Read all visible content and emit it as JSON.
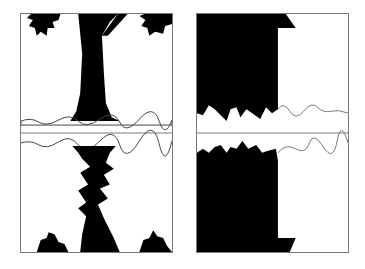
{
  "figure": {
    "panels": [
      {
        "name": "tree-reflection-panel",
        "subject": "tree trunk silhouette reflected across horizon"
      },
      {
        "name": "house-reflection-panel",
        "subject": "building and bush silhouette reflected across horizon"
      }
    ],
    "colors": {
      "ink": "#000000",
      "paper": "#ffffff",
      "frame": "#777777"
    }
  }
}
